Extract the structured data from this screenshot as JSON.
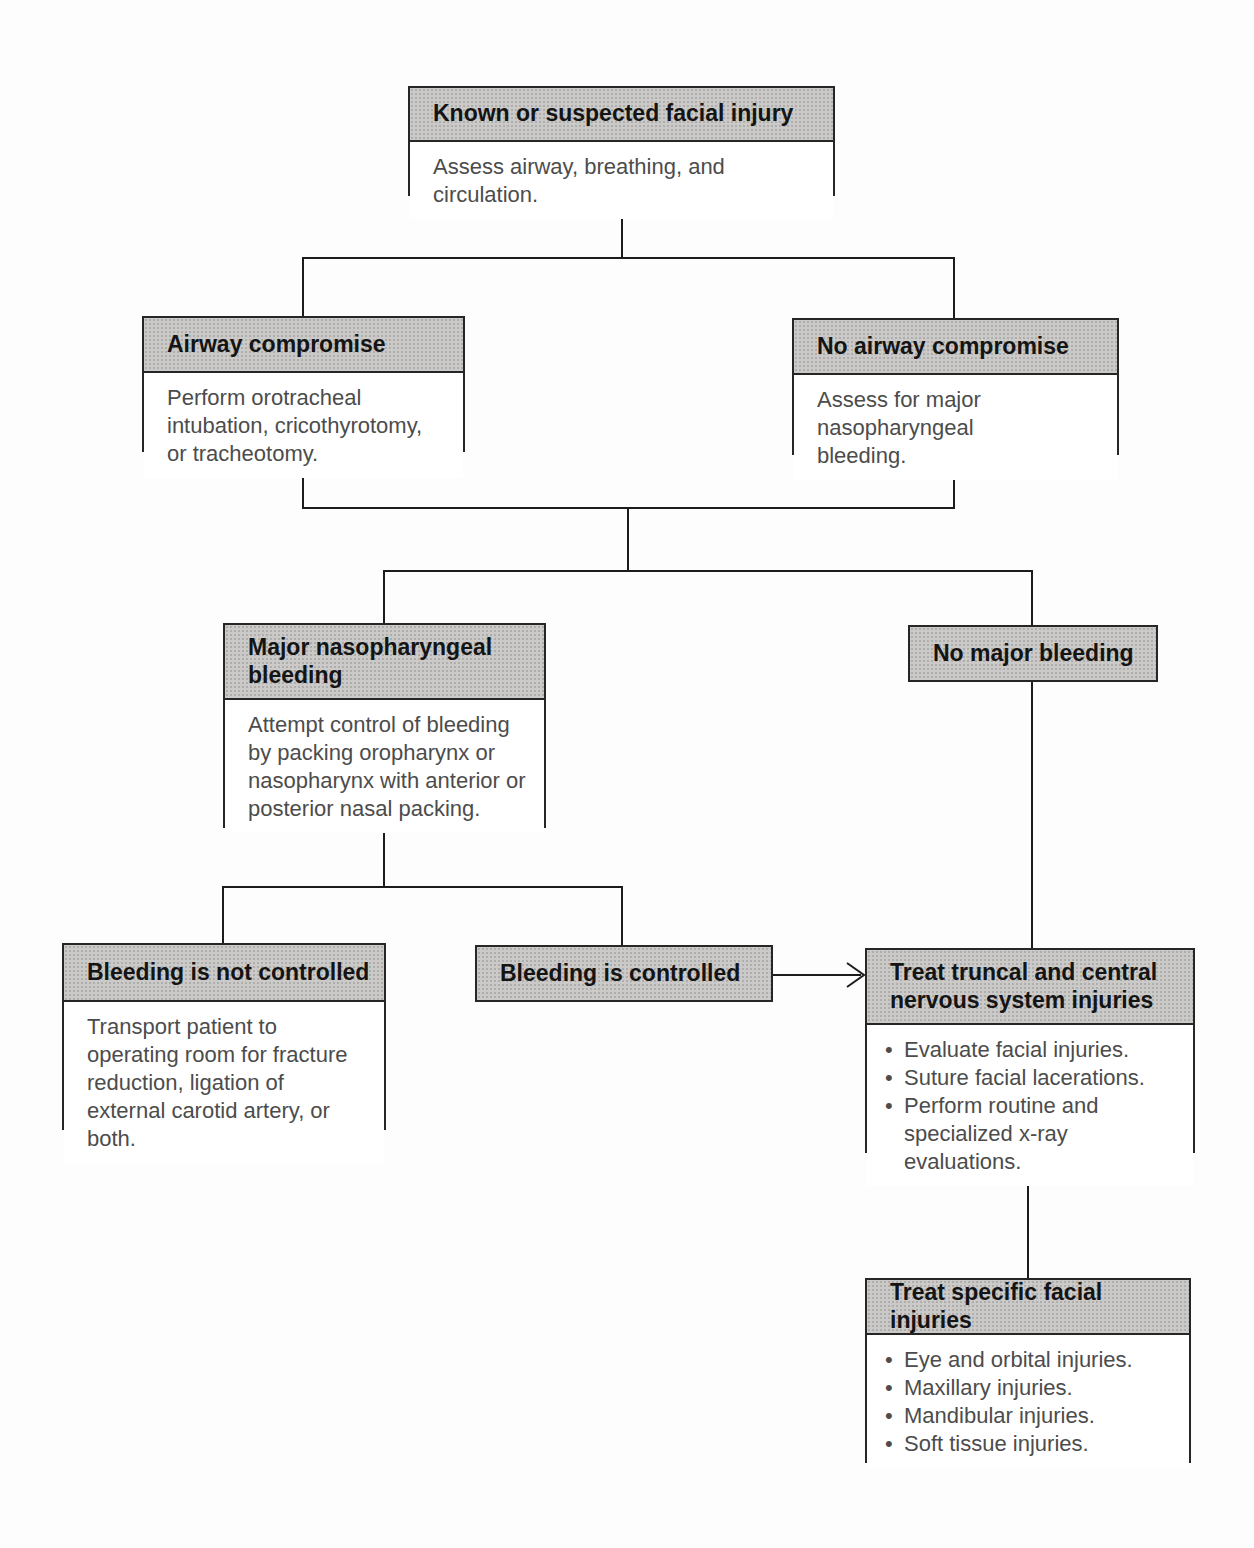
{
  "figure": {
    "type": "flowchart",
    "topic": "Management of known or suspected facial injury"
  },
  "colors": {
    "header_fill": "#cbcac8",
    "box_border": "#262626",
    "header_text": "#141414",
    "body_text": "#4c4c4c",
    "connector": "#1c1c1c",
    "page_background": "#fdfdfd"
  },
  "nodes": {
    "root": {
      "title": "Known or suspected facial injury",
      "body": "Assess airway, breathing, and circulation."
    },
    "airway_compromise": {
      "title": "Airway compromise",
      "body": "Perform orotracheal intubation, cricothyrotomy, or tracheotomy."
    },
    "no_airway_compromise": {
      "title": "No airway compromise",
      "body": "Assess for major nasopharyngeal bleeding."
    },
    "major_bleeding": {
      "title": "Major nasopharyngeal bleeding",
      "body": "Attempt control of bleeding by packing oropharynx or nasopharynx with anterior or posterior nasal packing."
    },
    "no_major_bleeding": {
      "title": "No major bleeding"
    },
    "bleeding_not_controlled": {
      "title": "Bleeding is not controlled",
      "body": "Transport patient to operating room for fracture reduction, ligation of external carotid artery, or both."
    },
    "bleeding_controlled": {
      "title": "Bleeding is controlled"
    },
    "treat_truncal": {
      "title": "Treat truncal and central nervous system injuries",
      "bullets": [
        "Evaluate facial injuries.",
        "Suture facial lacerations.",
        "Perform routine and specialized x-ray evaluations."
      ]
    },
    "treat_specific": {
      "title": "Treat specific facial injuries",
      "bullets": [
        "Eye and orbital injuries.",
        "Maxillary injuries.",
        "Mandibular injuries.",
        "Soft tissue injuries."
      ]
    }
  }
}
